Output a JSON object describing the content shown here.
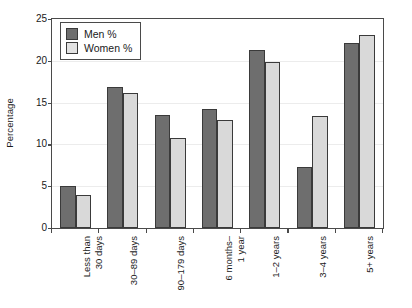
{
  "chart_data": {
    "type": "bar",
    "title": "",
    "xlabel": "",
    "ylabel": "Percentage",
    "ylim": [
      0,
      25
    ],
    "yticks": [
      0,
      5,
      10,
      15,
      20,
      25
    ],
    "grid": true,
    "legend_position": "top-left",
    "categories": [
      "Less than\n30 days",
      "30–89 days",
      "90–179 days",
      "6 months–\n1 year",
      "1–2 years",
      "3–4 years",
      "5+ years"
    ],
    "series": [
      {
        "name": "Men %",
        "color": "#6e6e6e",
        "values": [
          5.0,
          16.9,
          13.5,
          14.2,
          21.3,
          7.3,
          22.1
        ]
      },
      {
        "name": "Women %",
        "color": "#d9d9d9",
        "values": [
          4.0,
          16.1,
          10.8,
          12.9,
          19.9,
          13.4,
          23.1
        ]
      }
    ]
  },
  "legend": {
    "items": [
      {
        "label": "Men %",
        "swatch": "men"
      },
      {
        "label": "Women %",
        "swatch": "women"
      }
    ]
  },
  "axes": {
    "y_axis_title": "Percentage",
    "y_tick_labels": [
      "0",
      "5",
      "10",
      "15",
      "20",
      "25"
    ],
    "x_tick_labels": [
      "Less than\n30 days",
      "30–89 days",
      "90–179 days",
      "6 months–\n1 year",
      "1–2 years",
      "3–4 years",
      "5+ years"
    ]
  },
  "colors": {
    "men_bar": "#6e6e6e",
    "women_bar": "#d9d9d9",
    "bar_outline": "#3a3a3a",
    "axis": "#4a4a4a",
    "gridline": "#ececec",
    "background": "#ffffff"
  }
}
